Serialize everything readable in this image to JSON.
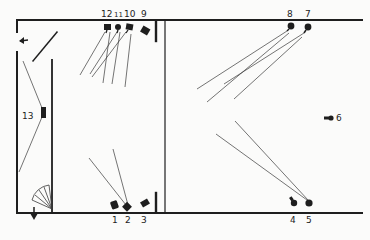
{
  "diagram": {
    "type": "lighting-plan",
    "colors": {
      "ink": "#1e1e1e",
      "beam": "#3a3a3a",
      "paper": "#fbfbfa"
    },
    "lamps": [
      {
        "id": "1",
        "label": "1",
        "x": 115,
        "y": 207,
        "lx": 113,
        "ly": 222
      },
      {
        "id": "2",
        "label": "2",
        "x": 128,
        "y": 208,
        "lx": 127,
        "ly": 222
      },
      {
        "id": "3",
        "label": "3",
        "x": 143,
        "y": 205,
        "lx": 144,
        "ly": 222
      },
      {
        "id": "4",
        "label": "4",
        "x": 294,
        "y": 202,
        "lx": 292,
        "ly": 222
      },
      {
        "id": "5",
        "label": "5",
        "x": 309,
        "y": 203,
        "lx": 309,
        "ly": 222
      },
      {
        "id": "6",
        "label": "6",
        "x": 330,
        "y": 118,
        "lx": 340,
        "ly": 121
      },
      {
        "id": "7",
        "label": "7",
        "x": 308,
        "y": 29,
        "lx": 308,
        "ly": 16
      },
      {
        "id": "8",
        "label": "8",
        "x": 291,
        "y": 27,
        "lx": 290,
        "ly": 16
      },
      {
        "id": "9",
        "label": "9",
        "x": 146,
        "y": 32,
        "lx": 145,
        "ly": 17
      },
      {
        "id": "10",
        "label": "10",
        "x": 130,
        "y": 27,
        "lx": 129,
        "ly": 17
      },
      {
        "id": "11",
        "label": "11",
        "x": 118,
        "y": 27,
        "lx": 118,
        "ly": 17
      },
      {
        "id": "12",
        "label": "12",
        "x": 108,
        "y": 27,
        "lx": 107,
        "ly": 17
      },
      {
        "id": "13",
        "label": "13",
        "x": 43,
        "y": 113,
        "lx": 24,
        "ly": 120
      }
    ],
    "arrows": [
      {
        "name": "exit-arrow-left",
        "direction": "left"
      },
      {
        "name": "exit-arrow-down",
        "direction": "down"
      }
    ]
  }
}
